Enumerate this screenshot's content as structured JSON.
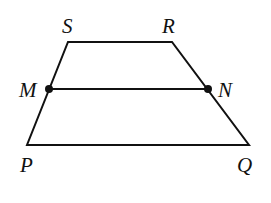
{
  "diagram": {
    "type": "trapezoid",
    "stroke_color": "#111111",
    "points": {
      "S": {
        "label": "S",
        "x": 68,
        "y": 42
      },
      "R": {
        "label": "R",
        "x": 172,
        "y": 42
      },
      "M": {
        "label": "M",
        "x": 49,
        "y": 89
      },
      "N": {
        "label": "N",
        "x": 208,
        "y": 89
      },
      "P": {
        "label": "P",
        "x": 27,
        "y": 145
      },
      "Q": {
        "label": "Q",
        "x": 249,
        "y": 145
      }
    },
    "segments": [
      "SR",
      "RQ",
      "QP",
      "PS",
      "MN"
    ],
    "marked_points": [
      "M",
      "N"
    ]
  }
}
